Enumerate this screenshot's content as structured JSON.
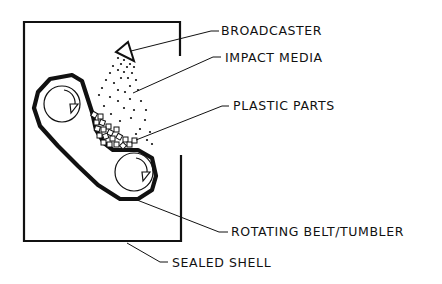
{
  "diagram": {
    "type": "technical-line-drawing",
    "labels": {
      "broadcaster": "BROADCASTER",
      "impact_media": "IMPACT MEDIA",
      "plastic_parts": "PLASTIC PARTS",
      "rotating_belt": "ROTATING BELT/TUMBLER",
      "sealed_shell": "SEALED SHELL"
    },
    "colors": {
      "ink": "#111111",
      "background": "#ffffff"
    }
  }
}
